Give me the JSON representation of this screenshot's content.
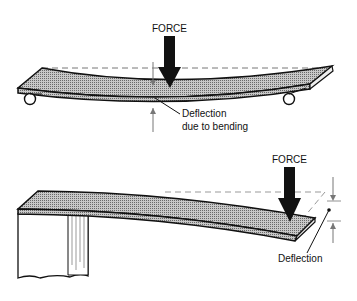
{
  "diagrams": [
    {
      "id": "simply-supported",
      "force_label": "FORCE",
      "deflection_label_line1": "Deflection",
      "deflection_label_line2": "due to bending"
    },
    {
      "id": "cantilever",
      "force_label": "FORCE",
      "deflection_label": "Deflection"
    }
  ],
  "colors": {
    "ink": "#111111",
    "fill": "#9a9a9a",
    "dash": "#777777"
  }
}
